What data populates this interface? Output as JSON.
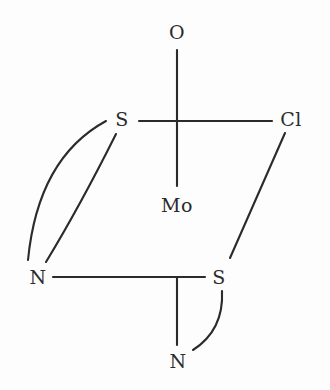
{
  "diagram": {
    "background_color": "#fdfdfd",
    "bond_color": "#2b2b2b",
    "label_color": "#2b2b2b",
    "width": 330,
    "height": 390
  },
  "atoms": [
    {
      "id": "o-top",
      "label": "O",
      "x": 177,
      "y": 32
    },
    {
      "id": "s-upper",
      "label": "S",
      "x": 122,
      "y": 119
    },
    {
      "id": "cl-right",
      "label": "Cl",
      "x": 291,
      "y": 119
    },
    {
      "id": "mo-center",
      "label": "Mo",
      "x": 177,
      "y": 205
    },
    {
      "id": "n-left",
      "label": "N",
      "x": 38,
      "y": 277
    },
    {
      "id": "s-lower",
      "label": "S",
      "x": 219,
      "y": 277
    },
    {
      "id": "n-bottom",
      "label": "N",
      "x": 178,
      "y": 361
    }
  ],
  "bonds": [
    {
      "id": "bond-o-mo",
      "from": "o-top",
      "to": "mo-center",
      "type": "line",
      "x1": 177,
      "y1": 50,
      "x2": 177,
      "y2": 186
    },
    {
      "id": "bond-s-upper-cl",
      "from": "s-upper",
      "to": "cl-right",
      "type": "line",
      "x1": 139,
      "y1": 121,
      "x2": 272,
      "y2": 121
    },
    {
      "id": "bond-s-upper-n-left-arc",
      "from": "s-upper",
      "to": "n-left",
      "type": "arc",
      "x1": 106,
      "y1": 121,
      "x2": 28,
      "y2": 260,
      "cx": 38,
      "cy": 158
    },
    {
      "id": "bond-s-upper-n-left-line",
      "from": "s-upper",
      "to": "n-left",
      "type": "arc",
      "x1": 116,
      "y1": 134,
      "x2": 46,
      "y2": 262,
      "cx": 80,
      "cy": 206
    },
    {
      "id": "bond-cl-s-lower",
      "from": "cl-right",
      "to": "s-lower",
      "type": "line",
      "x1": 285,
      "y1": 133,
      "x2": 230,
      "y2": 258
    },
    {
      "id": "bond-n-left-s-lower",
      "from": "n-left",
      "to": "s-lower",
      "type": "line",
      "x1": 53,
      "y1": 277,
      "x2": 205,
      "y2": 277
    },
    {
      "id": "bond-mo-n-bottom",
      "from": "mo-center",
      "to": "n-bottom",
      "type": "line",
      "x1": 177,
      "y1": 277,
      "x2": 177,
      "y2": 345
    },
    {
      "id": "bond-s-lower-n-bottom-arc",
      "from": "s-lower",
      "to": "n-bottom",
      "type": "arc",
      "x1": 222,
      "y1": 291,
      "x2": 193,
      "y2": 350,
      "cx": 224,
      "cy": 330
    }
  ]
}
